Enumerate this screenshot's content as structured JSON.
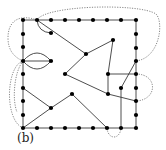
{
  "figure": {
    "label": "(b)",
    "colors": {
      "edge": "#3a3a3a",
      "dotted": "#6a6a6a",
      "vertex": "#000000",
      "background": "#ffffff"
    },
    "vertex_radius": 2.1,
    "grid_boundary": {
      "top": [
        [
          23,
          20
        ],
        [
          37,
          20
        ],
        [
          51,
          20
        ],
        [
          65,
          20
        ],
        [
          79,
          20
        ],
        [
          93,
          20
        ],
        [
          107,
          20
        ],
        [
          121,
          20
        ],
        [
          136,
          20
        ]
      ],
      "right": [
        [
          136,
          34
        ],
        [
          136,
          48
        ],
        [
          136,
          61
        ],
        [
          136,
          74
        ],
        [
          136,
          88
        ],
        [
          136,
          101
        ],
        [
          136,
          115
        ],
        [
          136,
          128
        ]
      ],
      "bottom": [
        [
          23,
          128
        ],
        [
          37,
          128
        ],
        [
          51,
          128
        ],
        [
          65,
          128
        ],
        [
          79,
          128
        ],
        [
          93,
          128
        ],
        [
          107,
          128
        ],
        [
          121,
          128
        ]
      ],
      "left": [
        [
          23,
          34
        ],
        [
          23,
          47
        ],
        [
          23,
          61
        ],
        [
          23,
          74
        ],
        [
          23,
          88
        ],
        [
          23,
          101
        ],
        [
          23,
          115
        ]
      ]
    },
    "interior_vertices": [
      [
        51,
        33
      ],
      [
        51,
        61
      ],
      [
        86,
        54
      ],
      [
        113,
        40
      ],
      [
        65,
        74
      ],
      [
        108,
        74
      ],
      [
        108,
        94
      ],
      [
        121,
        88
      ],
      [
        51,
        108
      ],
      [
        72,
        94
      ]
    ],
    "straight_edges": [
      [
        [
          37,
          20
        ],
        [
          86,
          54
        ]
      ],
      [
        [
          86,
          54
        ],
        [
          113,
          40
        ]
      ],
      [
        [
          113,
          40
        ],
        [
          108,
          74
        ]
      ],
      [
        [
          86,
          54
        ],
        [
          65,
          74
        ]
      ],
      [
        [
          108,
          74
        ],
        [
          136,
          74
        ]
      ],
      [
        [
          108,
          74
        ],
        [
          108,
          94
        ]
      ],
      [
        [
          136,
          61
        ],
        [
          121,
          88
        ]
      ],
      [
        [
          121,
          88
        ],
        [
          121,
          128
        ]
      ],
      [
        [
          23,
          61
        ],
        [
          51,
          61
        ]
      ],
      [
        [
          23,
          88
        ],
        [
          51,
          108
        ]
      ],
      [
        [
          51,
          108
        ],
        [
          23,
          128
        ]
      ],
      [
        [
          51,
          108
        ],
        [
          72,
          94
        ]
      ],
      [
        [
          72,
          94
        ],
        [
          107,
          128
        ]
      ],
      [
        [
          65,
          74
        ],
        [
          108,
          94
        ]
      ],
      [
        [
          108,
          94
        ],
        [
          136,
          101
        ]
      ]
    ],
    "curved_edges": [
      "M37,20 Q38,32 51,33",
      "M23,61 Q37,45 51,61",
      "M23,61 Q37,77 51,61"
    ],
    "dotted_curves": [
      "M37,20 C20,14 8,20 8,38 C8,52 16,58 23,61",
      "M37,20 C45,5 140,3 156,14 C164,22 160,58 136,61",
      "M136,74 C158,74 158,100 136,101",
      "M23,61 C6,66 4,120 23,128",
      "M23,61 C14,72 12,100 17,112",
      "M107,128 C108,140 120,140 121,128"
    ]
  }
}
